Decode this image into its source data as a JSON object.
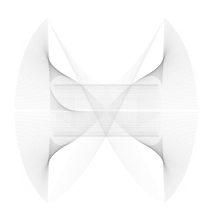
{
  "document": {
    "title": "String Art Line Envelope",
    "background_color": "#ffffff"
  },
  "figure": {
    "name": "bowtie-line-envelope",
    "description": "Dense string-art envelope forming an hourglass / butterfly silhouette with four cusped peaks and a pinched crosshatched waist",
    "canvas": {
      "width": 212,
      "height": 221
    },
    "stroke_color": "#9a9a9a",
    "stroke_width": 0.35,
    "stroke_opacity": 0.5,
    "center_x": 106,
    "center_y": 110.5
  },
  "chart_data": {
    "type": "line",
    "title": "",
    "subtitle": "",
    "xlabel": "",
    "ylabel": "",
    "grid": false,
    "legend": null,
    "axes_visible": false,
    "xlim": [
      0,
      212
    ],
    "ylim": [
      0,
      221
    ],
    "render_mode": "string-art-envelope",
    "generator": {
      "family": "parametric-chord-family",
      "point_count": 190,
      "chord_offset": 64,
      "pairs": [
        {
          "name": "outer-envelope-left-top",
          "anchor_a": [
            14,
            110
          ],
          "anchor_b": [
            46,
            18
          ]
        },
        {
          "name": "outer-envelope-right-top",
          "anchor_a": [
            198,
            110
          ],
          "anchor_b": [
            166,
            18
          ]
        },
        {
          "name": "outer-envelope-left-bottom",
          "anchor_a": [
            14,
            111
          ],
          "anchor_b": [
            46,
            203
          ]
        },
        {
          "name": "outer-envelope-right-bottom",
          "anchor_a": [
            198,
            111
          ],
          "anchor_b": [
            166,
            203
          ]
        }
      ]
    },
    "shape_params": {
      "a_radius": 92,
      "b_radius": 93,
      "waist_half_height": 26,
      "waist_half_width": 56,
      "peak_top_y": 18,
      "peak_bottom_y": 203,
      "left_x": 14,
      "right_x": 198,
      "cusp_count": 4,
      "lobe_harmonic": 2,
      "phase_offset_deg": 0
    },
    "series": [
      {
        "name": "lissajous-chord-bundle",
        "n_lines": 190,
        "freq_x": 1,
        "freq_y": 2,
        "phase": 1.5707963,
        "shear": 0.62,
        "values": []
      }
    ],
    "tone_stops": [
      {
        "position": 0.0,
        "color": "#f4f4f4",
        "label": "outer-fan-faint"
      },
      {
        "position": 0.45,
        "color": "#d6d6d6",
        "label": "mid-fan"
      },
      {
        "position": 0.75,
        "color": "#bdbdbd",
        "label": "waist-band"
      },
      {
        "position": 1.0,
        "color": "#a8a8a8",
        "label": "cross-hatch-core"
      }
    ]
  }
}
